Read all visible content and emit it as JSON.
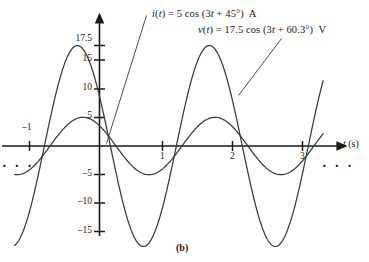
{
  "figure": {
    "caption": "(b)",
    "background": "#ffffff",
    "curve_color": "#3a3a3a",
    "axis_color": "#1a1a1a"
  },
  "annotations": {
    "current_equation": {
      "lhs": "i(t)",
      "full": "i(t) = 5 cos (3t + 45°)  A",
      "parts": [
        "i",
        "(",
        "t",
        ") = 5 cos (3",
        "t",
        " + 45°)  A"
      ],
      "amplitude": 5,
      "unit": "A"
    },
    "voltage_equation": {
      "lhs": "v(t)",
      "full": "v(t) = 17.5 cos (3t + 60.3°)  V",
      "parts": [
        "v",
        "(",
        "t",
        ") = 17.5 cos (3",
        "t",
        " + 60.3°)  V"
      ],
      "amplitude": 17.5,
      "unit": "V"
    },
    "left_ellipsis": "· · ·",
    "right_ellipsis": "· · ·"
  },
  "axes": {
    "x_label": "t (s)",
    "x_label_var": "t",
    "x_label_unit": " (s)",
    "x_ticks": [
      {
        "value": -1,
        "label": "–1"
      },
      {
        "value": 1,
        "label": "1"
      },
      {
        "value": 2,
        "label": "2"
      },
      {
        "value": 3,
        "label": "3"
      }
    ],
    "y_ticks": [
      {
        "value": 17.5,
        "label": "17.5"
      },
      {
        "value": 15,
        "label": "15"
      },
      {
        "value": 10,
        "label": "10"
      },
      {
        "value": 5,
        "label": "5"
      },
      {
        "value": -5,
        "label": "–5"
      },
      {
        "value": -10,
        "label": "–10"
      },
      {
        "value": -15,
        "label": "–15"
      }
    ]
  },
  "chart_data": {
    "type": "line",
    "title": "(b)",
    "xlabel": "t (s)",
    "ylabel": "",
    "xlim": [
      -1.35,
      3.55
    ],
    "ylim": [
      -19.5,
      19.5
    ],
    "grid": false,
    "legend": "inline-annotations",
    "series": [
      {
        "name": "v(t) = 17.5 cos (3t + 60.3°)  V",
        "amplitude": 17.5,
        "omega": 3,
        "phase_deg": 60.3,
        "unit": "V",
        "form": "A*cos(omega*t + phase)",
        "key_points": [
          {
            "t": -1.0,
            "v": -7.9
          },
          {
            "t": -0.9,
            "v": 0.0
          },
          {
            "t": -0.7,
            "v": 12.3
          },
          {
            "t": -0.35,
            "v": 17.5
          },
          {
            "t": 0.0,
            "v": 8.7
          },
          {
            "t": 0.16,
            "v": 0.0
          },
          {
            "t": 0.7,
            "v": -17.5
          },
          {
            "t": 1.2,
            "v": 0.0
          },
          {
            "t": 1.75,
            "v": 17.5
          },
          {
            "t": 2.3,
            "v": 0.0
          },
          {
            "t": 2.8,
            "v": -17.5
          },
          {
            "t": 3.35,
            "v": -9.5
          }
        ]
      },
      {
        "name": "i(t) = 5 cos (3t + 45°)  A",
        "amplitude": 5,
        "omega": 3,
        "phase_deg": 45,
        "unit": "A",
        "form": "A*cos(omega*t + phase)",
        "key_points": [
          {
            "t": -1.0,
            "v": -1.9
          },
          {
            "t": -0.78,
            "v": 0.0
          },
          {
            "t": -0.26,
            "v": 5.0
          },
          {
            "t": 0.0,
            "v": 3.5
          },
          {
            "t": 0.26,
            "v": 0.0
          },
          {
            "t": 0.79,
            "v": -5.0
          },
          {
            "t": 1.31,
            "v": 0.0
          },
          {
            "t": 1.83,
            "v": 5.0
          },
          {
            "t": 2.36,
            "v": 0.0
          },
          {
            "t": 2.88,
            "v": -5.0
          },
          {
            "t": 3.35,
            "v": -3.3
          }
        ]
      }
    ]
  }
}
